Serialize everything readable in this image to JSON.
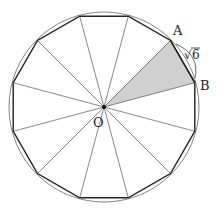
{
  "diagram": {
    "type": "regular dodecagon inscribed in circle",
    "center_label": "O",
    "vertex_labels": [
      "A",
      "B"
    ],
    "side_label": "√6",
    "side_label_radical": "√",
    "side_label_value": "6",
    "shaded_region": "triangle OAB",
    "colors": {
      "stroke": "#333333",
      "shade": "#d0d0d0",
      "circle": "#777777"
    }
  }
}
